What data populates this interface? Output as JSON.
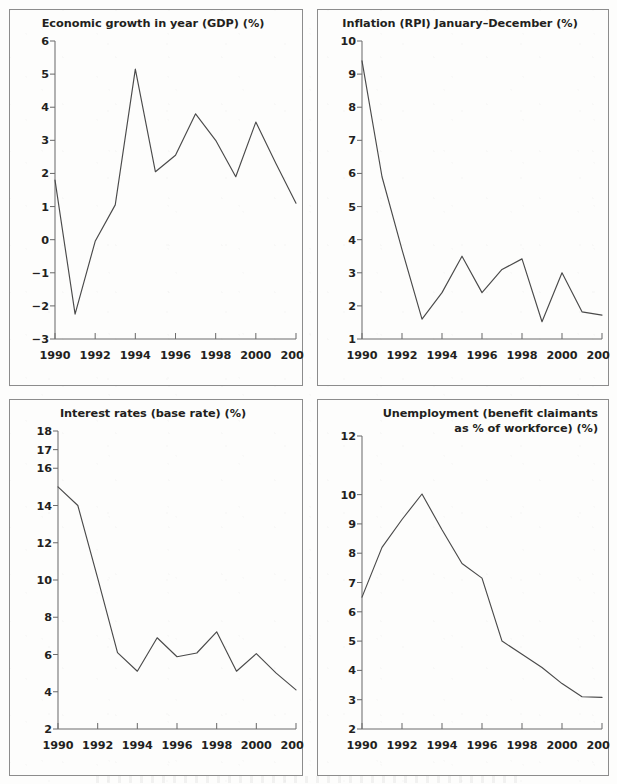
{
  "page": {
    "background_color": "#fdfdfc",
    "panel_border_color": "#8c8c8c",
    "line_color": "#4a4a4a",
    "text_color": "#231f20"
  },
  "charts": [
    {
      "id": "gdp",
      "title": "Economic growth in year (GDP) (%)",
      "title_lines": [
        "Economic growth in year (GDP) (%)"
      ],
      "ylabels": [
        "6",
        "5",
        "4",
        "3",
        "2",
        "1",
        "0",
        "−1",
        "−2",
        "−3"
      ],
      "xlabels": [
        "1990",
        "1992",
        "1994",
        "1996",
        "1998",
        "2000",
        "2002"
      ]
    },
    {
      "id": "inflation",
      "title": "Inflation (RPI) January–December (%)",
      "title_lines": [
        "Inflation (RPI) January–December (%)"
      ],
      "ylabels": [
        "10",
        "9",
        "8",
        "7",
        "6",
        "5",
        "4",
        "3",
        "2",
        "1"
      ],
      "xlabels": [
        "1990",
        "1992",
        "1994",
        "1996",
        "1998",
        "2000",
        "2002"
      ]
    },
    {
      "id": "interest",
      "title": "Interest rates (base rate) (%)",
      "title_lines": [
        "Interest rates (base rate) (%)"
      ],
      "ylabels": [
        "18",
        "17",
        "16",
        "14",
        "12",
        "10",
        "8",
        "6",
        "4",
        "2"
      ],
      "xlabels": [
        "1990",
        "1992",
        "1994",
        "1996",
        "1998",
        "2000",
        "2002"
      ]
    },
    {
      "id": "unemployment",
      "title": "Unemployment (benefit claimants as % of workforce) (%)",
      "title_lines": [
        "Unemployment (benefit claimants",
        "as % of workforce) (%)"
      ],
      "ylabels": [
        "12",
        "10",
        "9",
        "8",
        "7",
        "6",
        "5",
        "4",
        "3",
        "2"
      ],
      "xlabels": [
        "1990",
        "1992",
        "1994",
        "1996",
        "1998",
        "2000",
        "2002"
      ]
    }
  ],
  "chart_data": [
    {
      "type": "line",
      "id": "gdp",
      "title": "Economic growth in year (GDP) (%)",
      "xlabel": "",
      "ylabel": "",
      "x": [
        1990,
        1991,
        1992,
        1993,
        1994,
        1995,
        1996,
        1997,
        1998,
        1999,
        2000,
        2001,
        2002
      ],
      "values": [
        1.8,
        -2.25,
        -0.05,
        1.05,
        5.15,
        2.05,
        2.55,
        3.8,
        3.0,
        1.9,
        3.55,
        2.3,
        1.1
      ],
      "ylim": [
        -3,
        6
      ],
      "yticks": [
        -3,
        -2,
        -1,
        0,
        1,
        2,
        3,
        4,
        5,
        6
      ],
      "xlim": [
        1990,
        2002
      ],
      "xticks": [
        1990,
        1992,
        1994,
        1996,
        1998,
        2000,
        2002
      ],
      "grid": false,
      "legend": "none"
    },
    {
      "type": "line",
      "id": "inflation",
      "title": "Inflation (RPI) January–December (%)",
      "xlabel": "",
      "ylabel": "",
      "x": [
        1990,
        1991,
        1992,
        1993,
        1994,
        1995,
        1996,
        1997,
        1998,
        1999,
        2000,
        2001,
        2002
      ],
      "values": [
        9.4,
        5.9,
        3.7,
        1.6,
        2.4,
        3.5,
        2.4,
        3.1,
        3.42,
        1.52,
        3.0,
        1.82,
        1.72
      ],
      "ylim": [
        1,
        10
      ],
      "yticks": [
        1,
        2,
        3,
        4,
        5,
        6,
        7,
        8,
        9,
        10
      ],
      "xlim": [
        1990,
        2002
      ],
      "xticks": [
        1990,
        1992,
        1994,
        1996,
        1998,
        2000,
        2002
      ],
      "grid": false,
      "legend": "none"
    },
    {
      "type": "line",
      "id": "interest",
      "title": "Interest rates (base rate) (%)",
      "xlabel": "",
      "ylabel": "",
      "x": [
        1990,
        1991,
        1992,
        1993,
        1994,
        1995,
        1996,
        1997,
        1998,
        1999,
        2000,
        2001,
        2002
      ],
      "values": [
        15.0,
        14.0,
        10.1,
        6.1,
        5.1,
        6.9,
        5.88,
        6.08,
        7.22,
        5.1,
        6.05,
        5.0,
        4.1
      ],
      "ylim": [
        2,
        18
      ],
      "yticks": [
        2,
        4,
        6,
        8,
        10,
        12,
        14,
        16,
        17,
        18
      ],
      "xlim": [
        1990,
        2002
      ],
      "xticks": [
        1990,
        1992,
        1994,
        1996,
        1998,
        2000,
        2002
      ],
      "grid": false,
      "legend": "none"
    },
    {
      "type": "line",
      "id": "unemployment",
      "title": "Unemployment (benefit claimants as % of workforce) (%)",
      "xlabel": "",
      "ylabel": "",
      "x": [
        1990,
        1991,
        1992,
        1993,
        1994,
        1995,
        1996,
        1997,
        1998,
        1999,
        2000,
        2001,
        2002
      ],
      "values": [
        6.5,
        8.2,
        9.15,
        10.02,
        8.8,
        7.65,
        7.15,
        5.0,
        4.55,
        4.1,
        3.55,
        3.1,
        3.08
      ],
      "ylim": [
        2,
        12
      ],
      "yticks": [
        2,
        3,
        4,
        5,
        6,
        7,
        8,
        9,
        10,
        12
      ],
      "xlim": [
        1990,
        2002
      ],
      "xticks": [
        1990,
        1992,
        1994,
        1996,
        1998,
        2000,
        2002
      ],
      "grid": false,
      "legend": "none"
    }
  ]
}
